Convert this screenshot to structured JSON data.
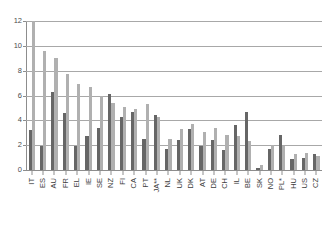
{
  "chart_data": {
    "type": "bar",
    "title": "",
    "subtitle": "",
    "xlabel": "",
    "ylabel": "",
    "ylim": [
      0,
      12
    ],
    "yticks": [
      0,
      2,
      4,
      6,
      8,
      10,
      12
    ],
    "ytick_labels": [
      "0",
      "2",
      "4",
      "6",
      "8",
      "10",
      "12"
    ],
    "grid": true,
    "legend": "none",
    "categories": [
      "IT",
      "ES",
      "AU",
      "FR",
      "EL",
      "IE",
      "SE",
      "NZ",
      "FI",
      "CA",
      "PT",
      "JA**",
      "NL",
      "UK",
      "DK",
      "AT",
      "DE",
      "CH",
      "IL",
      "BE",
      "SK",
      "NO",
      "PL*",
      "HU",
      "US",
      "CZ"
    ],
    "series": [
      {
        "name": "Series 1",
        "color": "#666666",
        "values": [
          3.2,
          1.9,
          6.3,
          4.6,
          1.9,
          2.7,
          3.4,
          6.1,
          4.3,
          4.7,
          2.5,
          4.4,
          1.7,
          2.4,
          3.3,
          1.9,
          2.4,
          1.6,
          3.6,
          4.7,
          0.2,
          1.7,
          2.8,
          0.9,
          1.0,
          1.3
        ]
      },
      {
        "name": "Series 2",
        "color": "#b0b0b0",
        "values": [
          12.0,
          9.6,
          9.0,
          7.7,
          6.9,
          6.7,
          6.0,
          5.4,
          5.1,
          4.9,
          5.3,
          4.3,
          2.5,
          3.3,
          3.7,
          3.1,
          3.4,
          2.8,
          2.7,
          2.3,
          0.4,
          2.0,
          1.9,
          1.3,
          1.4,
          1.1
        ]
      }
    ]
  }
}
